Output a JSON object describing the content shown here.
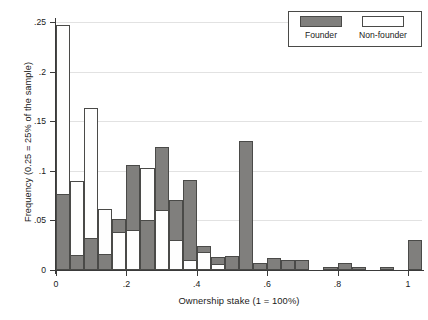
{
  "chart_data": {
    "type": "bar",
    "title": "",
    "subtitle": "",
    "xlabel": "Ownership stake (1 = 100%)",
    "ylabel": "Frequency (0.25 = 25% of the sample)",
    "xlim": [
      0,
      1.04
    ],
    "ylim": [
      0,
      0.25
    ],
    "grid": true,
    "grid_axis": "y",
    "legend_position": "top-right",
    "bin_width": 0.04,
    "xticks": [
      0,
      0.2,
      0.4,
      0.6,
      0.8,
      1
    ],
    "xticklabels": [
      "0",
      ".2",
      ".4",
      ".6",
      ".8",
      "1"
    ],
    "yticks": [
      0,
      0.05,
      0.1,
      0.15,
      0.2,
      0.25
    ],
    "yticklabels": [
      "0",
      ".05",
      ".1",
      ".15",
      ".2",
      ".25"
    ],
    "bin_starts": [
      0.0,
      0.04,
      0.08,
      0.12,
      0.16,
      0.2,
      0.24,
      0.28,
      0.32,
      0.36,
      0.4,
      0.44,
      0.48,
      0.52,
      0.56,
      0.6,
      0.64,
      0.68,
      0.72,
      0.76,
      0.8,
      0.84,
      0.88,
      0.92,
      0.96,
      1.0
    ],
    "series": [
      {
        "name": "Founder",
        "color": "#807f7d",
        "values": [
          0.077,
          0.015,
          0.032,
          0.016,
          0.051,
          0.106,
          0.05,
          0.124,
          0.071,
          0.091,
          0.024,
          0.013,
          0.014,
          0.13,
          0.007,
          0.012,
          0.01,
          0.01,
          0.0,
          0.003,
          0.007,
          0.003,
          0.0,
          0.003,
          0.0,
          0.03
        ]
      },
      {
        "name": "Non-founder",
        "color": "#ffffff",
        "values": [
          0.247,
          0.09,
          0.163,
          0.062,
          0.038,
          0.04,
          0.103,
          0.06,
          0.03,
          0.01,
          0.018,
          0.006,
          0.0,
          0.0,
          0.0,
          0.0,
          0.0,
          0.0,
          0.0,
          0.0,
          0.0,
          0.0,
          0.0,
          0.0,
          0.0,
          0.0
        ]
      }
    ]
  },
  "legend": {
    "founder_label": "Founder",
    "nonfounder_label": "Non-founder"
  }
}
